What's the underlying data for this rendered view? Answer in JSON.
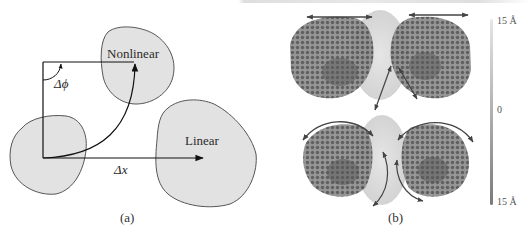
{
  "figure": {
    "panel_a": {
      "caption": "(a)",
      "labels": {
        "nonlinear": "Nonlinear",
        "linear": "Linear",
        "delta_phi": "Δϕ",
        "delta_x": "Δx⃗"
      },
      "colors": {
        "blob_fill": "#e2e2e2",
        "blob_stroke": "#555555",
        "arrow": "#111111"
      }
    },
    "panel_b": {
      "caption": "(b)",
      "colorbar": {
        "top_label": "15 Å",
        "mid_label": "0",
        "bottom_label": "15 Å",
        "top_color": "#e6e6e6",
        "bottom_color": "#7a7a7a"
      },
      "colors": {
        "protein_dark": "#5a5a5a",
        "protein_core": "#d9d9d9",
        "arrow": "#444444"
      }
    }
  }
}
